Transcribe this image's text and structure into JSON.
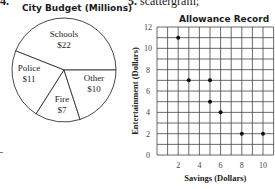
{
  "header": {
    "left_number": "4.",
    "right_number": "5.",
    "right_label": "scattergram;"
  },
  "chart_data": [
    {
      "type": "pie",
      "title": "City Budget (Millions)",
      "slices": [
        {
          "name": "Schools",
          "value": 22,
          "label": "$22"
        },
        {
          "name": "Police",
          "value": 11,
          "label": "$11"
        },
        {
          "name": "Fire",
          "value": 7,
          "label": "$7"
        },
        {
          "name": "Other",
          "value": 10,
          "label": "$10"
        }
      ],
      "start_angle_deg": 0,
      "direction": "counterclockwise",
      "fill": "#ffffff",
      "stroke": "#333333"
    },
    {
      "type": "scatter",
      "title": "Allowance Record",
      "xlabel": "Savings (Dollars)",
      "ylabel": "Entertainment (Dollars)",
      "xlim": [
        0,
        11
      ],
      "ylim": [
        0,
        12
      ],
      "xticks": [
        2,
        4,
        6,
        8,
        10
      ],
      "yticks": [
        0,
        2,
        4,
        6,
        8,
        10,
        12
      ],
      "grid": true,
      "grid_step": 1,
      "points": [
        {
          "x": 2,
          "y": 11
        },
        {
          "x": 3,
          "y": 7
        },
        {
          "x": 5,
          "y": 7
        },
        {
          "x": 5,
          "y": 5
        },
        {
          "x": 6,
          "y": 4
        },
        {
          "x": 8,
          "y": 2
        },
        {
          "x": 10,
          "y": 2
        }
      ],
      "marker_color": "#111111"
    }
  ]
}
